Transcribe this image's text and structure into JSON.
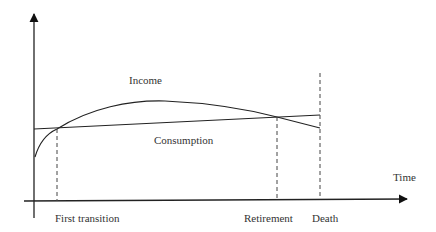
{
  "diagram": {
    "curves": {
      "income_label": "Income",
      "consumption_label": "Consumption"
    },
    "axes": {
      "x_label": "Time"
    },
    "markers": [
      {
        "label": "First transition"
      },
      {
        "label": "Retirement"
      },
      {
        "label": "Death"
      }
    ],
    "colors": {
      "line": "#222222",
      "text": "#333333",
      "dashed": "#444444"
    }
  }
}
